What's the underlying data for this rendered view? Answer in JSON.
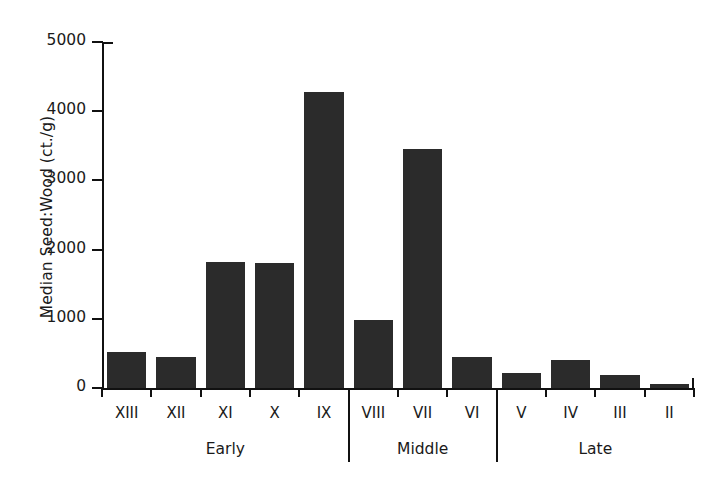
{
  "chart_data": {
    "type": "bar",
    "title": "",
    "xlabel": "",
    "ylabel": "Median Seed:Wood (ct./g)",
    "ylim": [
      0,
      5000
    ],
    "yticks": [
      0,
      1000,
      2000,
      3000,
      4000,
      5000
    ],
    "ytick_labels": [
      "0",
      "1000",
      "2000",
      "3000",
      "4000",
      "5000"
    ],
    "grid": false,
    "legend": "none",
    "bar_color": "#2b2b2b",
    "axis_color": "#111111",
    "categories": [
      "XIII",
      "XII",
      "XI",
      "X",
      "IX",
      "VIII",
      "VII",
      "VI",
      "V",
      "IV",
      "III",
      "II"
    ],
    "values": [
      520,
      450,
      1820,
      1805,
      4280,
      980,
      3455,
      450,
      215,
      405,
      190,
      60
    ],
    "groups": [
      {
        "label": "Early",
        "categories": [
          "XIII",
          "XII",
          "XI",
          "X",
          "IX"
        ]
      },
      {
        "label": "Middle",
        "categories": [
          "VIII",
          "VII",
          "VI"
        ]
      },
      {
        "label": "Late",
        "categories": [
          "V",
          "IV",
          "III",
          "II"
        ]
      }
    ]
  }
}
